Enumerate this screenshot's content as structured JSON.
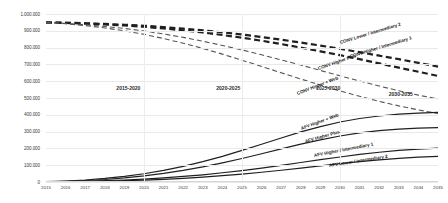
{
  "chart_data": {
    "type": "line",
    "title": "",
    "subtitle": "",
    "xlabel": "",
    "ylabel": "",
    "xlim": [
      2015,
      2035
    ],
    "ylim": [
      0,
      1000000
    ],
    "grid": true,
    "legend_position": "inline-annotations",
    "x": [
      2015,
      2016,
      2017,
      2018,
      2019,
      2020,
      2021,
      2022,
      2023,
      2024,
      2025,
      2026,
      2027,
      2028,
      2029,
      2030,
      2031,
      2032,
      2033,
      2034,
      2035
    ],
    "xtick_labels": [
      "2015",
      "2016",
      "2017",
      "2018",
      "2019",
      "2020",
      "2021",
      "2022",
      "2023",
      "2024",
      "2025",
      "2026",
      "2027",
      "2028",
      "2029",
      "2030",
      "2031",
      "2032",
      "2033",
      "2034",
      "2035"
    ],
    "ytick_labels": [
      "0",
      "100.000",
      "200.000",
      "300.000",
      "400.000",
      "500.000",
      "600.000",
      "700.000",
      "800.000",
      "900.000",
      "1.000.000"
    ],
    "ytick_values": [
      0,
      100000,
      200000,
      300000,
      400000,
      500000,
      600000,
      700000,
      800000,
      900000,
      1000000
    ],
    "series": [
      {
        "name": "CONV Lower / Intermediary 2",
        "style": "dashed",
        "width": 2.2,
        "color": "#1f1f1f",
        "values": [
          950000,
          948000,
          945000,
          941000,
          936000,
          930000,
          922000,
          913000,
          903000,
          891000,
          878000,
          863000,
          847000,
          830000,
          812000,
          793000,
          773000,
          752000,
          731000,
          709000,
          687000
        ]
      },
      {
        "name": "CONV Higher / Intermediary 1",
        "style": "dashed",
        "width": 2.2,
        "color": "#1f1f1f",
        "values": [
          950000,
          947000,
          943000,
          938000,
          932000,
          924000,
          914000,
          903000,
          890000,
          875000,
          859000,
          841000,
          821000,
          800000,
          778000,
          755000,
          731000,
          706000,
          681000,
          656000,
          631000
        ]
      },
      {
        "name": "CONV Higher Plus",
        "style": "dashed",
        "width": 1.1,
        "color": "#555555",
        "values": [
          950000,
          944000,
          936000,
          926000,
          914000,
          899000,
          881000,
          861000,
          838000,
          813000,
          786000,
          757000,
          727000,
          696000,
          664000,
          632000,
          601000,
          571000,
          543000,
          517000,
          494000
        ]
      },
      {
        "name": "CONV Higher + Web",
        "style": "dashed",
        "width": 1.1,
        "color": "#555555",
        "values": [
          950000,
          942000,
          931000,
          917000,
          900000,
          879000,
          854000,
          826000,
          795000,
          761000,
          725000,
          688000,
          650000,
          613000,
          577000,
          542000,
          510000,
          480000,
          453000,
          429000,
          408000
        ]
      },
      {
        "name": "AFV Higher + Web",
        "style": "solid",
        "width": 1.2,
        "color": "#1f1f1f",
        "values": [
          2000,
          6000,
          12000,
          21000,
          33000,
          49000,
          69000,
          93000,
          121000,
          153000,
          188000,
          225000,
          262000,
          298000,
          330000,
          357000,
          378000,
          393000,
          404000,
          410000,
          414000
        ]
      },
      {
        "name": "AFV Higher Plus",
        "style": "solid",
        "width": 1.2,
        "color": "#1f1f1f",
        "values": [
          1500,
          4500,
          9000,
          15000,
          24000,
          36000,
          51000,
          69000,
          90000,
          114000,
          140000,
          168000,
          197000,
          225000,
          251000,
          274000,
          292000,
          306000,
          315000,
          321000,
          324000
        ]
      },
      {
        "name": "AFV Higher / Intermediary 1",
        "style": "solid",
        "width": 1.2,
        "color": "#1f1f1f",
        "values": [
          800,
          2200,
          4500,
          7800,
          12000,
          17500,
          24500,
          33000,
          43000,
          55000,
          68000,
          83000,
          99000,
          116000,
          133000,
          149000,
          164000,
          177000,
          188000,
          196000,
          202000
        ]
      },
      {
        "name": "AFV Lower / Intermediary 2",
        "style": "solid",
        "width": 1.2,
        "color": "#1f1f1f",
        "values": [
          500,
          1400,
          2900,
          5000,
          7800,
          11500,
          16200,
          22000,
          29000,
          37500,
          47000,
          58000,
          70000,
          83000,
          96000,
          109000,
          121000,
          132000,
          141000,
          148000,
          153000
        ]
      }
    ],
    "annotations": [
      {
        "text": "2015-2020",
        "x": 2019.2,
        "y": 580000
      },
      {
        "text": "2020-2025",
        "x": 2024.3,
        "y": 580000
      },
      {
        "text": "2025-2030",
        "x": 2029.4,
        "y": 580000
      },
      {
        "text": "2030-2035",
        "x": 2033.1,
        "y": 540000
      }
    ],
    "series_labels": [
      {
        "text": "CONV Lower / Intermediary 2",
        "x": 340,
        "y": 40,
        "rotate": -17
      },
      {
        "text": "CONV Higher / Intermediary 1",
        "x": 350,
        "y": 54,
        "rotate": -17
      },
      {
        "text": "CONV Higher Plus",
        "x": 318,
        "y": 66,
        "rotate": -19
      },
      {
        "text": "CONV Higher + Web",
        "x": 297,
        "y": 91,
        "rotate": -21
      },
      {
        "text": "AFV Higher + Web",
        "x": 301,
        "y": 126,
        "rotate": -20
      },
      {
        "text": "AFV Higher Plus",
        "x": 305,
        "y": 139,
        "rotate": -16
      },
      {
        "text": "AFV Higher / Intermediary 1",
        "x": 314,
        "y": 153,
        "rotate": -11
      },
      {
        "text": "AFV Lower / Intermediary 2",
        "x": 329,
        "y": 163,
        "rotate": -9
      }
    ]
  }
}
